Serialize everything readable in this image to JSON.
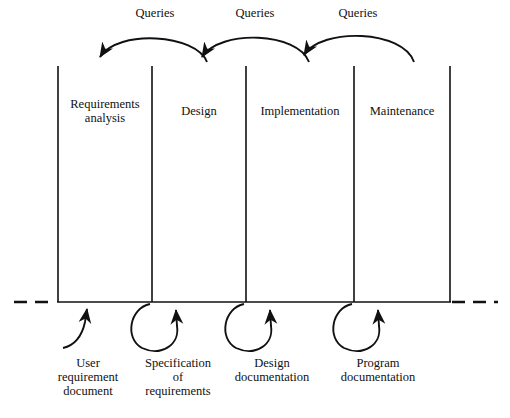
{
  "diagram": {
    "stroke_color": "#111111",
    "background_color": "#ffffff",
    "queries": [
      {
        "label": "Queries",
        "x": 155,
        "y": 7
      },
      {
        "label": "Queries",
        "x": 255,
        "y": 7
      },
      {
        "label": "Queries",
        "x": 358,
        "y": 7
      }
    ],
    "phases": [
      {
        "label": "Requirements\nanalysis",
        "x": 58,
        "width": 94,
        "text_y": 98
      },
      {
        "label": "Design",
        "x": 152,
        "width": 94,
        "text_y": 105
      },
      {
        "label": "Implementation",
        "x": 246,
        "width": 108,
        "text_y": 105
      },
      {
        "label": "Maintenance",
        "x": 354,
        "width": 96,
        "text_y": 105
      }
    ],
    "dividers": [
      58,
      152,
      246,
      354,
      450
    ],
    "baseline_y": 302,
    "documents": [
      {
        "label": "User\nrequirement\ndocument",
        "x": 88,
        "text_y": 358,
        "loop_type": "hook"
      },
      {
        "label": "Specification\nof\nrequirements",
        "x": 178,
        "text_y": 358,
        "loop_type": "circle"
      },
      {
        "label": "Design\ndocumentation",
        "x": 272,
        "text_y": 358,
        "loop_type": "circle"
      },
      {
        "label": "Program\ndocumentation",
        "x": 378,
        "text_y": 358,
        "loop_type": "circle"
      }
    ],
    "dashes": {
      "left": {
        "from_x": 14,
        "to_x": 56
      },
      "right": {
        "from_x": 452,
        "to_x": 498
      }
    }
  }
}
